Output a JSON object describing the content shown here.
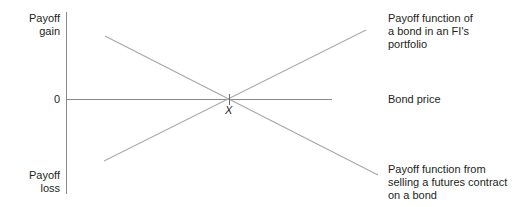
{
  "diagram": {
    "y_axis": {
      "top_label": "Payoff\ngain",
      "bottom_label": "Payoff\nloss",
      "zero_label": "0"
    },
    "x_axis": {
      "label": "Bond price",
      "intersection_label": "X"
    },
    "lines": [
      {
        "id": "bond-payoff",
        "label": "Payoff function of\na bond in an FI's\nportfolio",
        "slope": "positive"
      },
      {
        "id": "futures-short-payoff",
        "label": "Payoff function from\nselling a futures contract\non a bond",
        "slope": "negative"
      }
    ],
    "colors": {
      "axis": "#8a8a8a",
      "payoff_line": "#a8a8a8",
      "text": "#231f20"
    }
  }
}
